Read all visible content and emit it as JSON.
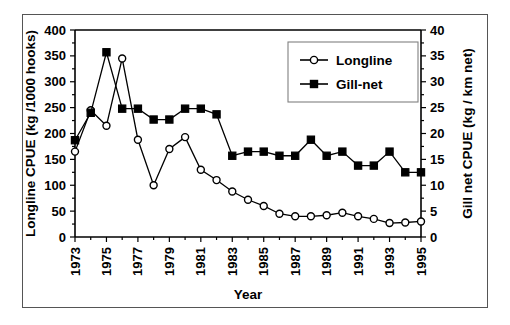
{
  "chart_data": {
    "type": "line",
    "title": "",
    "xlabel": "Year",
    "ylabel": "Longline CPUE (kg /1000 hooks)",
    "y2label": "Gill net CPUE (kg / km net)",
    "grid": false,
    "legend_position": "top-right",
    "x": [
      1973,
      1974,
      1975,
      1976,
      1977,
      1978,
      1979,
      1980,
      1981,
      1982,
      1983,
      1984,
      1985,
      1986,
      1987,
      1988,
      1989,
      1990,
      1991,
      1992,
      1993,
      1994,
      1995
    ],
    "xlim": [
      1973,
      1995
    ],
    "xtick_labels": [
      "1973",
      "1975",
      "1977",
      "1979",
      "1981",
      "1983",
      "1985",
      "1987",
      "1989",
      "1991",
      "1993",
      "1995"
    ],
    "xtick_values": [
      1973,
      1975,
      1977,
      1979,
      1981,
      1983,
      1985,
      1987,
      1989,
      1991,
      1993,
      1995
    ],
    "ylim": [
      0,
      400
    ],
    "ytick_labels": [
      "0",
      "50",
      "100",
      "150",
      "200",
      "250",
      "300",
      "350",
      "400"
    ],
    "ytick_values": [
      0,
      50,
      100,
      150,
      200,
      250,
      300,
      350,
      400
    ],
    "y2lim": [
      0,
      40
    ],
    "y2tick_labels": [
      "0",
      "5",
      "10",
      "15",
      "20",
      "25",
      "30",
      "35",
      "40"
    ],
    "y2tick_values": [
      0,
      5,
      10,
      15,
      20,
      25,
      30,
      35,
      40
    ],
    "series": [
      {
        "name": "Longline",
        "axis": "left",
        "marker": "open-circle",
        "values": [
          165,
          245,
          215,
          345,
          188,
          100,
          170,
          193,
          130,
          110,
          88,
          72,
          60,
          45,
          40,
          40,
          42,
          47,
          40,
          35,
          27,
          28,
          30
        ]
      },
      {
        "name": "Gill-net",
        "axis": "right",
        "marker": "filled-square",
        "values": [
          18.7,
          24.0,
          35.7,
          24.8,
          24.8,
          22.7,
          22.7,
          24.8,
          24.8,
          23.7,
          15.7,
          16.5,
          16.5,
          15.7,
          15.7,
          18.8,
          15.7,
          16.5,
          13.8,
          13.8,
          16.5,
          12.5,
          12.5
        ]
      }
    ]
  },
  "legend": {
    "entries": [
      {
        "label": "Longline"
      },
      {
        "label": "Gill-net"
      }
    ]
  },
  "axes": {
    "x_title": "Year",
    "y_left_title": "Longline CPUE (kg /1000 hooks)",
    "y_right_title": "Gill net CPUE (kg / km net)"
  },
  "colors": {
    "line": "#000000",
    "marker_open_fill": "#ffffff",
    "marker_filled_fill": "#000000",
    "frame": "#555555",
    "legend_border": "#808080",
    "background": "#ffffff"
  }
}
